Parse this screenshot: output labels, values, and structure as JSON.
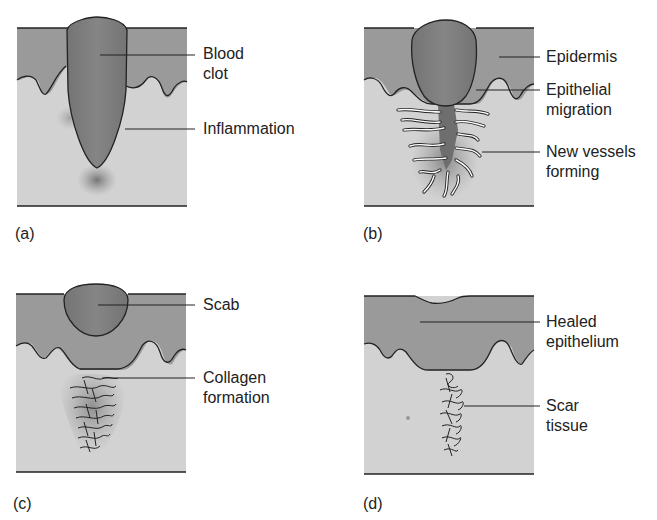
{
  "diagram": {
    "type": "wound-healing-stages",
    "colors": {
      "epidermis": "#9a9a9a",
      "dermis": "#d2d2d2",
      "clot": "#7e7e7e",
      "line": "#222222",
      "vessel": "#ffffff"
    },
    "panels": [
      {
        "id": "a",
        "panel_label": "(a)",
        "labels": [
          {
            "text": "Blood\nclot"
          },
          {
            "text": "Inflammation"
          }
        ]
      },
      {
        "id": "b",
        "panel_label": "(b)",
        "labels": [
          {
            "text": "Epidermis"
          },
          {
            "text": "Epithelial\nmigration"
          },
          {
            "text": "New vessels\nforming"
          }
        ]
      },
      {
        "id": "c",
        "panel_label": "(c)",
        "labels": [
          {
            "text": "Scab"
          },
          {
            "text": "Collagen\nformation"
          }
        ]
      },
      {
        "id": "d",
        "panel_label": "(d)",
        "labels": [
          {
            "text": "Healed\nepithelium"
          },
          {
            "text": "Scar\ntissue"
          }
        ]
      }
    ]
  }
}
